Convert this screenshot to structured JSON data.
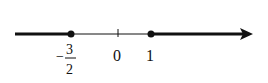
{
  "number_line": {
    "colors": {
      "line": "#111111",
      "background": "#ffffff"
    },
    "points": [
      {
        "value": -1.5,
        "label_sign": "−",
        "label_num": "3",
        "label_den": "2",
        "closed": true
      },
      {
        "value": 0,
        "label": "0",
        "tick": true
      },
      {
        "value": 1,
        "label": "1",
        "closed": true
      }
    ],
    "solution_set": "x ≤ -3/2 or x ≥ 1",
    "arrow_direction": "right"
  }
}
